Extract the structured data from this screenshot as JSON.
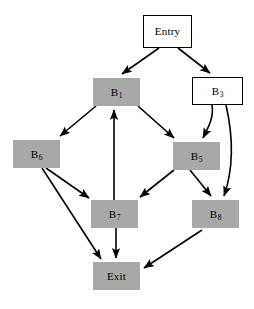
{
  "diagram": {
    "type": "control-flow-graph",
    "background_color": "#ffffff",
    "filled_node_color": "#a8a8a8",
    "plain_node_color": "#ffffff",
    "edge_color": "#000000",
    "width": 254,
    "height": 309
  },
  "nodes": [
    {
      "id": "entry",
      "label": "Entry",
      "base": "Entry",
      "subscript": "",
      "style": "plain",
      "x": 143,
      "y": 15,
      "w": 49,
      "h": 33
    },
    {
      "id": "b1",
      "label": "B1",
      "base": "B",
      "subscript": "1",
      "style": "filled",
      "x": 93,
      "y": 78,
      "w": 47,
      "h": 28
    },
    {
      "id": "b3",
      "label": "B3",
      "base": "B",
      "subscript": "3",
      "style": "plain",
      "x": 192,
      "y": 77,
      "w": 51,
      "h": 28
    },
    {
      "id": "b6",
      "label": "B6",
      "base": "B",
      "subscript": "6",
      "style": "filled",
      "x": 13,
      "y": 140,
      "w": 47,
      "h": 28
    },
    {
      "id": "b5",
      "label": "B5",
      "base": "B",
      "subscript": "5",
      "style": "filled",
      "x": 173,
      "y": 142,
      "w": 47,
      "h": 28
    },
    {
      "id": "b7",
      "label": "B7",
      "base": "B",
      "subscript": "7",
      "style": "filled",
      "x": 91,
      "y": 200,
      "w": 47,
      "h": 28
    },
    {
      "id": "b8",
      "label": "B8",
      "base": "B",
      "subscript": "8",
      "style": "filled",
      "x": 192,
      "y": 200,
      "w": 47,
      "h": 28
    },
    {
      "id": "exit",
      "label": "Exit",
      "base": "Exit",
      "subscript": "",
      "style": "filled",
      "x": 93,
      "y": 262,
      "w": 47,
      "h": 28
    }
  ],
  "edges": [
    {
      "id": "entry-b1",
      "from": "entry",
      "to": "b1",
      "shape": "line"
    },
    {
      "id": "entry-b3",
      "from": "entry",
      "to": "b3",
      "shape": "line"
    },
    {
      "id": "b1-b6",
      "from": "b1",
      "to": "b6",
      "shape": "line"
    },
    {
      "id": "b1-b5",
      "from": "b1",
      "to": "b5",
      "shape": "line"
    },
    {
      "id": "b3-b5",
      "from": "b3",
      "to": "b5",
      "shape": "curve"
    },
    {
      "id": "b3-b8",
      "from": "b3",
      "to": "b8",
      "shape": "curve"
    },
    {
      "id": "b6-b7",
      "from": "b6",
      "to": "b7",
      "shape": "line"
    },
    {
      "id": "b6-exit",
      "from": "b6",
      "to": "exit",
      "shape": "line"
    },
    {
      "id": "b5-b7",
      "from": "b5",
      "to": "b7",
      "shape": "line"
    },
    {
      "id": "b5-b8",
      "from": "b5",
      "to": "b8",
      "shape": "line"
    },
    {
      "id": "b7-b1",
      "from": "b7",
      "to": "b1",
      "shape": "line"
    },
    {
      "id": "b7-exit",
      "from": "b7",
      "to": "exit",
      "shape": "line"
    },
    {
      "id": "b8-exit",
      "from": "b8",
      "to": "exit",
      "shape": "line"
    }
  ]
}
